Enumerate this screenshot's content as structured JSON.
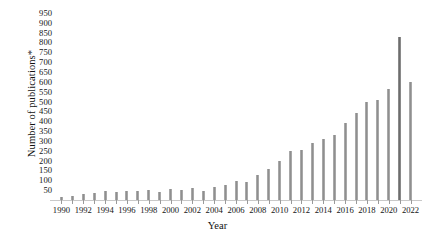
{
  "chart_data": {
    "type": "bar",
    "title": "",
    "xlabel": "Year",
    "ylabel": "Number of publications*",
    "categories": [
      1990,
      1991,
      1992,
      1993,
      1994,
      1995,
      1996,
      1997,
      1998,
      1999,
      2000,
      2001,
      2002,
      2003,
      2004,
      2005,
      2006,
      2007,
      2008,
      2009,
      2010,
      2011,
      2012,
      2013,
      2014,
      2015,
      2016,
      2017,
      2018,
      2019,
      2020,
      2021,
      2022
    ],
    "values": [
      15,
      18,
      30,
      35,
      45,
      42,
      48,
      45,
      50,
      40,
      55,
      50,
      60,
      45,
      65,
      75,
      95,
      90,
      125,
      155,
      200,
      250,
      255,
      290,
      310,
      330,
      390,
      440,
      500,
      510,
      565,
      830,
      600
    ],
    "ylim": [
      0,
      975
    ],
    "yticks": [
      50,
      100,
      150,
      200,
      250,
      300,
      350,
      400,
      450,
      500,
      550,
      600,
      650,
      700,
      750,
      800,
      850,
      900,
      950
    ],
    "xticks_labeled": [
      1990,
      1992,
      1994,
      1996,
      1998,
      2000,
      2002,
      2004,
      2006,
      2008,
      2010,
      2012,
      2014,
      2016,
      2018,
      2020,
      2022
    ],
    "grid": false,
    "legend": "none",
    "bar_color": "#8f8f8f",
    "highlight_color": "#6d6d6d",
    "axis_color": "#c9c9c9"
  }
}
